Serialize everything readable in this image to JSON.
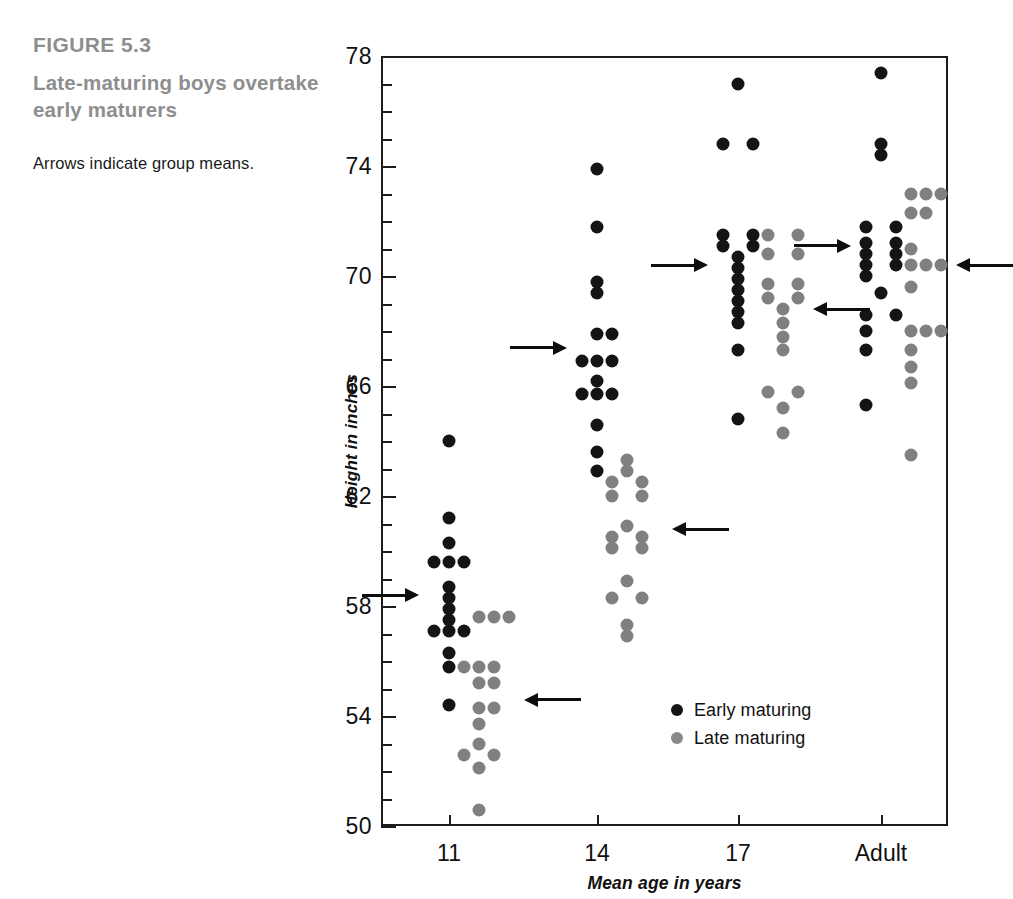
{
  "figure": {
    "number": "FIGURE 5.3",
    "title": "Late-maturing boys overtake early maturers",
    "note": "Arrows indicate group means."
  },
  "colors": {
    "early": "#141414",
    "late": "#808080",
    "caption": "#8e8e8e",
    "axis": "#1c1c1c"
  },
  "legend": {
    "position": "bottom-right-inside",
    "entries": [
      {
        "label": "Early maturing",
        "series": "early"
      },
      {
        "label": "Late maturing",
        "series": "late"
      }
    ]
  },
  "chart_data": {
    "type": "scatter",
    "title": "Late-maturing boys overtake early maturers",
    "subtitle": "Arrows indicate group means.",
    "annotation": "Arrows indicate group means.",
    "xlabel": "Mean age in years",
    "ylabel": "Height in inches",
    "categories": [
      "11",
      "14",
      "17",
      "Adult"
    ],
    "xtick_labels": [
      "11",
      "14",
      "17",
      "Adult"
    ],
    "ytick_labels": [
      "50",
      "54",
      "58",
      "62",
      "66",
      "70",
      "74",
      "78"
    ],
    "ytick_values": [
      50,
      54,
      58,
      62,
      66,
      70,
      74,
      78
    ],
    "yminor_step": 1,
    "ylim": [
      50,
      78
    ],
    "grid": false,
    "legend_position": "lower right",
    "series": [
      {
        "name": "Early maturing",
        "color": "#141414",
        "points": [
          {
            "category": "11",
            "jitter": 0,
            "value": 64.0
          },
          {
            "category": "11",
            "jitter": 0,
            "value": 61.2
          },
          {
            "category": "11",
            "jitter": 0,
            "value": 60.3
          },
          {
            "category": "11",
            "jitter": -1,
            "value": 59.6
          },
          {
            "category": "11",
            "jitter": 0,
            "value": 59.6
          },
          {
            "category": "11",
            "jitter": 1,
            "value": 59.6
          },
          {
            "category": "11",
            "jitter": 0,
            "value": 58.7
          },
          {
            "category": "11",
            "jitter": 0,
            "value": 58.3
          },
          {
            "category": "11",
            "jitter": 0,
            "value": 57.9
          },
          {
            "category": "11",
            "jitter": 0,
            "value": 57.5
          },
          {
            "category": "11",
            "jitter": -1,
            "value": 57.1
          },
          {
            "category": "11",
            "jitter": 0,
            "value": 57.1
          },
          {
            "category": "11",
            "jitter": 1,
            "value": 57.1
          },
          {
            "category": "11",
            "jitter": 0,
            "value": 56.3
          },
          {
            "category": "11",
            "jitter": 0,
            "value": 55.8
          },
          {
            "category": "11",
            "jitter": 0,
            "value": 54.4
          },
          {
            "category": "14",
            "jitter": 0,
            "value": 73.9
          },
          {
            "category": "14",
            "jitter": 0,
            "value": 71.8
          },
          {
            "category": "14",
            "jitter": 0,
            "value": 69.8
          },
          {
            "category": "14",
            "jitter": 0,
            "value": 69.4
          },
          {
            "category": "14",
            "jitter": 0,
            "value": 67.9
          },
          {
            "category": "14",
            "jitter": 1,
            "value": 67.9
          },
          {
            "category": "14",
            "jitter": -1,
            "value": 66.9
          },
          {
            "category": "14",
            "jitter": 0,
            "value": 66.9
          },
          {
            "category": "14",
            "jitter": 1,
            "value": 66.9
          },
          {
            "category": "14",
            "jitter": 0,
            "value": 66.2
          },
          {
            "category": "14",
            "jitter": -1,
            "value": 65.7
          },
          {
            "category": "14",
            "jitter": 0,
            "value": 65.7
          },
          {
            "category": "14",
            "jitter": 1,
            "value": 65.7
          },
          {
            "category": "14",
            "jitter": 0,
            "value": 64.6
          },
          {
            "category": "14",
            "jitter": 0,
            "value": 63.6
          },
          {
            "category": "14",
            "jitter": 0,
            "value": 62.9
          },
          {
            "category": "17",
            "jitter": 0,
            "value": 77.0
          },
          {
            "category": "17",
            "jitter": -1,
            "value": 74.8
          },
          {
            "category": "17",
            "jitter": 1,
            "value": 74.8
          },
          {
            "category": "17",
            "jitter": -1,
            "value": 71.5
          },
          {
            "category": "17",
            "jitter": 1,
            "value": 71.5
          },
          {
            "category": "17",
            "jitter": -1,
            "value": 71.1
          },
          {
            "category": "17",
            "jitter": 1,
            "value": 71.1
          },
          {
            "category": "17",
            "jitter": 0,
            "value": 70.7
          },
          {
            "category": "17",
            "jitter": 0,
            "value": 70.3
          },
          {
            "category": "17",
            "jitter": 0,
            "value": 69.9
          },
          {
            "category": "17",
            "jitter": 0,
            "value": 69.5
          },
          {
            "category": "17",
            "jitter": 0,
            "value": 69.1
          },
          {
            "category": "17",
            "jitter": 0,
            "value": 68.7
          },
          {
            "category": "17",
            "jitter": 0,
            "value": 68.3
          },
          {
            "category": "17",
            "jitter": 0,
            "value": 67.3
          },
          {
            "category": "17",
            "jitter": 0,
            "value": 64.8
          },
          {
            "category": "Adult",
            "jitter": 0,
            "value": 77.4
          },
          {
            "category": "Adult",
            "jitter": 0,
            "value": 74.8
          },
          {
            "category": "Adult",
            "jitter": 0,
            "value": 74.4
          },
          {
            "category": "Adult",
            "jitter": -1,
            "value": 71.8
          },
          {
            "category": "Adult",
            "jitter": 1,
            "value": 71.8
          },
          {
            "category": "Adult",
            "jitter": -1,
            "value": 71.2
          },
          {
            "category": "Adult",
            "jitter": 1,
            "value": 71.2
          },
          {
            "category": "Adult",
            "jitter": -1,
            "value": 70.8
          },
          {
            "category": "Adult",
            "jitter": 1,
            "value": 70.8
          },
          {
            "category": "Adult",
            "jitter": -1,
            "value": 70.4
          },
          {
            "category": "Adult",
            "jitter": 1,
            "value": 70.4
          },
          {
            "category": "Adult",
            "jitter": -1,
            "value": 70.0
          },
          {
            "category": "Adult",
            "jitter": 0,
            "value": 69.4
          },
          {
            "category": "Adult",
            "jitter": -1,
            "value": 68.6
          },
          {
            "category": "Adult",
            "jitter": 1,
            "value": 68.6
          },
          {
            "category": "Adult",
            "jitter": -1,
            "value": 68.0
          },
          {
            "category": "Adult",
            "jitter": -1,
            "value": 67.3
          },
          {
            "category": "Adult",
            "jitter": -1,
            "value": 65.3
          }
        ]
      },
      {
        "name": "Late maturing",
        "color": "#808080",
        "points": [
          {
            "category": "11",
            "jitter": 2,
            "value": 57.6
          },
          {
            "category": "11",
            "jitter": 3,
            "value": 57.6
          },
          {
            "category": "11",
            "jitter": 4,
            "value": 57.6
          },
          {
            "category": "11",
            "jitter": 1,
            "value": 55.8
          },
          {
            "category": "11",
            "jitter": 2,
            "value": 55.8
          },
          {
            "category": "11",
            "jitter": 3,
            "value": 55.8
          },
          {
            "category": "11",
            "jitter": 2,
            "value": 55.2
          },
          {
            "category": "11",
            "jitter": 3,
            "value": 55.2
          },
          {
            "category": "11",
            "jitter": 2,
            "value": 54.3
          },
          {
            "category": "11",
            "jitter": 3,
            "value": 54.3
          },
          {
            "category": "11",
            "jitter": 2,
            "value": 53.7
          },
          {
            "category": "11",
            "jitter": 2,
            "value": 53.0
          },
          {
            "category": "11",
            "jitter": 1,
            "value": 52.6
          },
          {
            "category": "11",
            "jitter": 3,
            "value": 52.6
          },
          {
            "category": "11",
            "jitter": 2,
            "value": 52.1
          },
          {
            "category": "11",
            "jitter": 2,
            "value": 50.6
          },
          {
            "category": "14",
            "jitter": 2,
            "value": 63.3
          },
          {
            "category": "14",
            "jitter": 2,
            "value": 62.9
          },
          {
            "category": "14",
            "jitter": 1,
            "value": 62.5
          },
          {
            "category": "14",
            "jitter": 3,
            "value": 62.5
          },
          {
            "category": "14",
            "jitter": 1,
            "value": 62.0
          },
          {
            "category": "14",
            "jitter": 3,
            "value": 62.0
          },
          {
            "category": "14",
            "jitter": 2,
            "value": 60.9
          },
          {
            "category": "14",
            "jitter": 1,
            "value": 60.5
          },
          {
            "category": "14",
            "jitter": 3,
            "value": 60.5
          },
          {
            "category": "14",
            "jitter": 1,
            "value": 60.1
          },
          {
            "category": "14",
            "jitter": 3,
            "value": 60.1
          },
          {
            "category": "14",
            "jitter": 2,
            "value": 58.9
          },
          {
            "category": "14",
            "jitter": 1,
            "value": 58.3
          },
          {
            "category": "14",
            "jitter": 3,
            "value": 58.3
          },
          {
            "category": "14",
            "jitter": 2,
            "value": 57.3
          },
          {
            "category": "14",
            "jitter": 2,
            "value": 56.9
          },
          {
            "category": "17",
            "jitter": 2,
            "value": 71.5
          },
          {
            "category": "17",
            "jitter": 4,
            "value": 71.5
          },
          {
            "category": "17",
            "jitter": 2,
            "value": 70.8
          },
          {
            "category": "17",
            "jitter": 4,
            "value": 70.8
          },
          {
            "category": "17",
            "jitter": 2,
            "value": 69.7
          },
          {
            "category": "17",
            "jitter": 4,
            "value": 69.7
          },
          {
            "category": "17",
            "jitter": 2,
            "value": 69.2
          },
          {
            "category": "17",
            "jitter": 4,
            "value": 69.2
          },
          {
            "category": "17",
            "jitter": 3,
            "value": 68.8
          },
          {
            "category": "17",
            "jitter": 3,
            "value": 68.3
          },
          {
            "category": "17",
            "jitter": 3,
            "value": 67.8
          },
          {
            "category": "17",
            "jitter": 3,
            "value": 67.3
          },
          {
            "category": "17",
            "jitter": 2,
            "value": 65.8
          },
          {
            "category": "17",
            "jitter": 4,
            "value": 65.8
          },
          {
            "category": "17",
            "jitter": 3,
            "value": 65.2
          },
          {
            "category": "17",
            "jitter": 3,
            "value": 64.3
          },
          {
            "category": "Adult",
            "jitter": 2,
            "value": 73.0
          },
          {
            "category": "Adult",
            "jitter": 3,
            "value": 73.0
          },
          {
            "category": "Adult",
            "jitter": 4,
            "value": 73.0
          },
          {
            "category": "Adult",
            "jitter": 2,
            "value": 72.3
          },
          {
            "category": "Adult",
            "jitter": 3,
            "value": 72.3
          },
          {
            "category": "Adult",
            "jitter": 2,
            "value": 71.0
          },
          {
            "category": "Adult",
            "jitter": 2,
            "value": 70.4
          },
          {
            "category": "Adult",
            "jitter": 3,
            "value": 70.4
          },
          {
            "category": "Adult",
            "jitter": 4,
            "value": 70.4
          },
          {
            "category": "Adult",
            "jitter": 2,
            "value": 69.6
          },
          {
            "category": "Adult",
            "jitter": 2,
            "value": 68.0
          },
          {
            "category": "Adult",
            "jitter": 3,
            "value": 68.0
          },
          {
            "category": "Adult",
            "jitter": 4,
            "value": 68.0
          },
          {
            "category": "Adult",
            "jitter": 2,
            "value": 67.3
          },
          {
            "category": "Adult",
            "jitter": 2,
            "value": 66.7
          },
          {
            "category": "Adult",
            "jitter": 2,
            "value": 66.1
          },
          {
            "category": "Adult",
            "jitter": 2,
            "value": 63.5
          }
        ]
      }
    ],
    "means": [
      {
        "category": "11",
        "series": "early",
        "value": 58.4,
        "direction": "right"
      },
      {
        "category": "11",
        "series": "late",
        "value": 54.6,
        "direction": "left"
      },
      {
        "category": "14",
        "series": "early",
        "value": 67.4,
        "direction": "right"
      },
      {
        "category": "14",
        "series": "late",
        "value": 60.8,
        "direction": "left"
      },
      {
        "category": "17",
        "series": "early",
        "value": 70.4,
        "direction": "right"
      },
      {
        "category": "17",
        "series": "late",
        "value": 68.8,
        "direction": "left"
      },
      {
        "category": "Adult",
        "series": "early",
        "value": 71.1,
        "direction": "right"
      },
      {
        "category": "Adult",
        "series": "late",
        "value": 70.4,
        "direction": "left"
      }
    ]
  }
}
